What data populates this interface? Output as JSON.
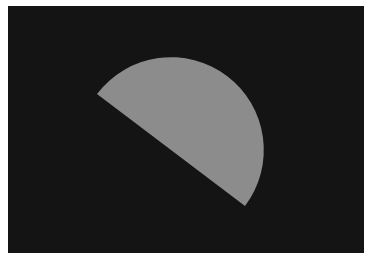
{
  "image": {
    "description": "Gray half-disc (semicircle) on a near-black rectangular background",
    "background_color": "#ffffff",
    "panel": {
      "x": 8,
      "y": 6,
      "width": 356,
      "height": 247,
      "color": "#141414"
    },
    "shape": {
      "type": "semicircle",
      "color": "#8c8c8c",
      "chord_start": [
        97,
        94
      ],
      "chord_end": [
        245,
        206
      ],
      "radius": 93
    }
  }
}
